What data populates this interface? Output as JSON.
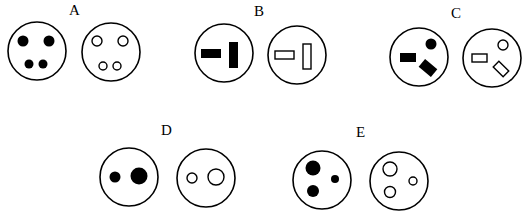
{
  "figure": {
    "colors": {
      "ink": "#000000",
      "background": "#ffffff"
    },
    "options": [
      {
        "label": "A",
        "pin_shapes": "2 large round pins on top, 2 smaller round pins below"
      },
      {
        "label": "B",
        "pin_shapes": "1 horizontal rectangle, 1 vertical rectangle"
      },
      {
        "label": "C",
        "pin_shapes": "1 horizontal rectangle, 1 round pin upper-right, 1 tilted rectangle lower-right"
      },
      {
        "label": "D",
        "pin_shapes": "1 small round pin, 1 large round pin side by side"
      },
      {
        "label": "E",
        "pin_shapes": "1 large round pin top-left, 1 medium round pin bottom-left, 1 small round pin right"
      }
    ]
  }
}
